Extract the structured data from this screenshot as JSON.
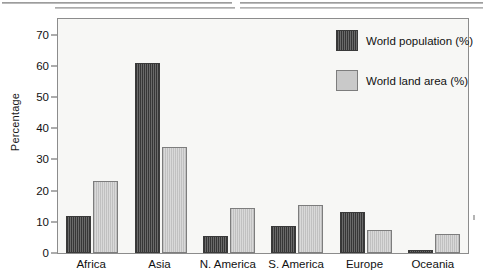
{
  "chart_data": {
    "type": "bar",
    "title": "",
    "xlabel": "",
    "ylabel": "Percentage",
    "ylim": [
      0,
      75
    ],
    "yticks": [
      0,
      10,
      20,
      30,
      40,
      50,
      60,
      70
    ],
    "grid": false,
    "legend_position": "top-right",
    "categories": [
      "Africa",
      "Asia",
      "N. America",
      "S. America",
      "Europe",
      "Oceania"
    ],
    "series": [
      {
        "name": "World population (%)",
        "color": "#4e4e4e",
        "values": [
          12,
          61,
          5.5,
          8.5,
          13,
          1
        ]
      },
      {
        "name": "World land area (%)",
        "color": "#c9c9c9",
        "values": [
          23,
          34,
          14.5,
          15.5,
          7.5,
          6
        ]
      }
    ]
  },
  "axis": {
    "y_title": "Percentage",
    "y_tick_labels": [
      "0",
      "10",
      "20",
      "30",
      "40",
      "50",
      "60",
      "70"
    ]
  },
  "legend": {
    "items": [
      {
        "label": "World population (%)"
      },
      {
        "label": "World land area (%)"
      }
    ]
  }
}
